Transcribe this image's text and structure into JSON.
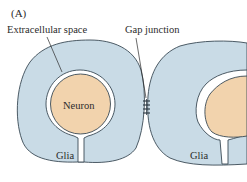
{
  "panel_label": "(A)",
  "labels": {
    "extracellular_space": "Extracellular space",
    "gap_junction": "Gap junction",
    "neuron": "Neuron",
    "glia_left": "Glia",
    "glia_right": "Glia"
  },
  "colors": {
    "glia_fill": "#c9dbe6",
    "neuron_fill": "#f2d3ad",
    "outline": "#3a4a55",
    "space_fill": "#ffffff"
  }
}
